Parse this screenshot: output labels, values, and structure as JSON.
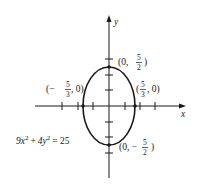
{
  "diagram": {
    "type": "ellipse-graph",
    "equation": {
      "coef_x": "9x",
      "exp_x": "2",
      "plus": "+",
      "coef_y": "4y",
      "exp_y": "2",
      "eq": "= 25"
    },
    "axes": {
      "x_label": "x",
      "y_label": "y"
    },
    "points": {
      "top": {
        "open": "(0, ",
        "num": "5",
        "den": "2",
        "close": ")"
      },
      "bottom": {
        "open": "(0, −",
        "num": "5",
        "den": "2",
        "close": ")"
      },
      "left": {
        "open": "(−",
        "num": "5",
        "den": "3",
        "close": ", 0)"
      },
      "right": {
        "open": "(",
        "num": "5",
        "den": "3",
        "close": ", 0)"
      }
    },
    "colors": {
      "stroke": "#1a1a1a",
      "background": "#ffffff"
    }
  }
}
